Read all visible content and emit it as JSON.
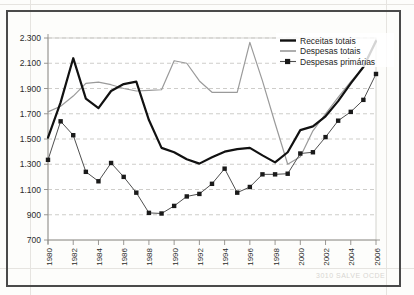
{
  "figure": {
    "kind": "line-chart",
    "language": "pt-BR"
  },
  "legend": {
    "items": [
      {
        "label": "Receitas totais",
        "style": "thick-black-line",
        "color": "#111111"
      },
      {
        "label": "Despesas totais",
        "style": "thin-gray-line",
        "color": "#9a9a9a"
      },
      {
        "label": "Despesas primárias",
        "style": "line-with-square-markers",
        "color": "#4f4f4f"
      }
    ]
  },
  "axes": {
    "y_tick_labels": [
      "2.300",
      "2.100",
      "1.900",
      "1.700",
      "1.500",
      "1.300",
      "1.100",
      "900",
      "700"
    ],
    "y_tick_values": [
      2300,
      2100,
      1900,
      1700,
      1500,
      1300,
      1100,
      900,
      700
    ],
    "x_tick_labels": [
      "1980",
      "1982",
      "1984",
      "1986",
      "1988",
      "1990",
      "1992",
      "1994",
      "1996",
      "1998",
      "2000",
      "2002",
      "2004",
      "2006"
    ],
    "x_tick_values": [
      1980,
      1982,
      1984,
      1986,
      1988,
      1990,
      1992,
      1994,
      1996,
      1998,
      2000,
      2002,
      2004,
      2006
    ]
  },
  "chart_data": {
    "type": "line",
    "title": "",
    "subtitle": "",
    "xlabel": "",
    "ylabel": "",
    "xlim": [
      1980,
      2006
    ],
    "ylim": [
      700,
      2300
    ],
    "grid": true,
    "legend_position": "top-right",
    "x": [
      1980,
      1981,
      1982,
      1983,
      1984,
      1985,
      1986,
      1987,
      1988,
      1989,
      1990,
      1991,
      1992,
      1993,
      1994,
      1995,
      1996,
      1997,
      1998,
      1999,
      2000,
      2001,
      2002,
      2003,
      2004,
      2005,
      2006
    ],
    "categories": [
      "1980",
      "1981",
      "1982",
      "1983",
      "1984",
      "1985",
      "1986",
      "1987",
      "1988",
      "1989",
      "1990",
      "1991",
      "1992",
      "1993",
      "1994",
      "1995",
      "1996",
      "1997",
      "1998",
      "1999",
      "2000",
      "2001",
      "2002",
      "2003",
      "2004",
      "2005",
      "2006"
    ],
    "series": [
      {
        "name": "Receitas totais",
        "color": "#111111",
        "values": [
          1510,
          1790,
          2140,
          1820,
          1745,
          1880,
          1935,
          1955,
          1650,
          1430,
          1395,
          1340,
          1305,
          1355,
          1400,
          1420,
          1430,
          1370,
          1315,
          1395,
          1570,
          1600,
          1680,
          1800,
          1940,
          2070,
          2275
        ]
      },
      {
        "name": "Despesas totais",
        "color": "#9a9a9a",
        "values": [
          1715,
          1760,
          1840,
          1940,
          1950,
          1930,
          1900,
          1880,
          1885,
          1890,
          2120,
          2100,
          1960,
          1870,
          1870,
          1870,
          2265,
          1960,
          1625,
          1300,
          1360,
          1565,
          1700,
          1830,
          1955,
          2070,
          2290
        ]
      },
      {
        "name": "Despesas primárias",
        "color": "#4f4f4f",
        "values": [
          1335,
          1640,
          1530,
          1240,
          1165,
          1310,
          1200,
          1075,
          915,
          910,
          970,
          1045,
          1065,
          1145,
          1265,
          1075,
          1120,
          1220,
          1220,
          1225,
          1385,
          1395,
          1515,
          1645,
          1715,
          1810,
          2015
        ]
      }
    ]
  },
  "scan_artifacts": {
    "ghost_text_bottom_right": "3010 SALVE OCDE",
    "ghost_text_top_right": "·"
  }
}
